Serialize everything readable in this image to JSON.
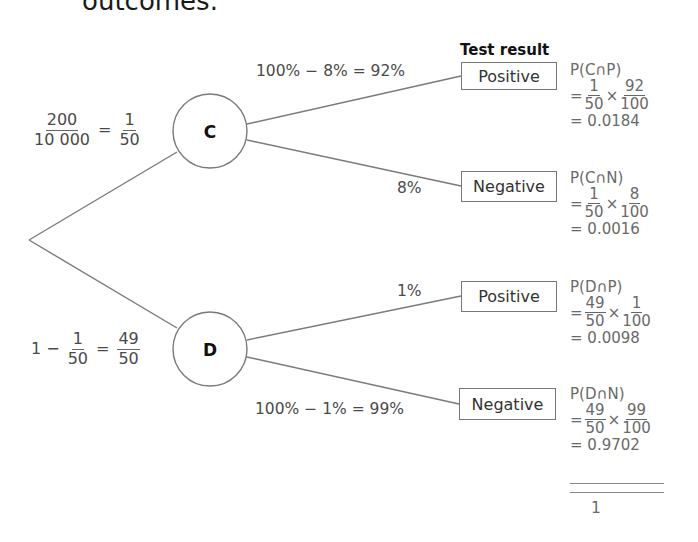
{
  "heading_fragment": "outcomes.",
  "test_result_title": "Test result",
  "geometry": {
    "root": [
      29,
      240
    ],
    "nodes": {
      "C": {
        "cx": 210,
        "cy": 131,
        "r": 37
      },
      "D": {
        "cx": 210,
        "cy": 349,
        "r": 37
      }
    },
    "boxes": [
      {
        "x": 461,
        "y": 62,
        "w": 96,
        "h": 28
      },
      {
        "x": 461,
        "y": 171,
        "w": 96,
        "h": 31
      },
      {
        "x": 461,
        "y": 281,
        "w": 96,
        "h": 31
      },
      {
        "x": 459,
        "y": 388,
        "w": 97,
        "h": 32
      }
    ]
  },
  "first_level": {
    "C": {
      "label": "C",
      "prob_lhs_num": "200",
      "prob_lhs_den": "10 000",
      "eq": "=",
      "prob_rhs_num": "1",
      "prob_rhs_den": "50"
    },
    "D": {
      "label": "D",
      "prob_prefix": "1 −",
      "prob_mid_num": "1",
      "prob_mid_den": "50",
      "eq": "=",
      "prob_rhs_num": "49",
      "prob_rhs_den": "50"
    }
  },
  "branches": [
    {
      "from": "C",
      "outcome": "Positive",
      "branch_label": "100% − 8% = 92%",
      "calc": {
        "title": "P(C∩P)",
        "f1_num": "1",
        "f1_den": "50",
        "f2_num": "92",
        "f2_den": "100",
        "result": "= 0.0184"
      }
    },
    {
      "from": "C",
      "outcome": "Negative",
      "branch_label": "8%",
      "calc": {
        "title": "P(C∩N)",
        "f1_num": "1",
        "f1_den": "50",
        "f2_num": "8",
        "f2_den": "100",
        "result": "= 0.0016"
      }
    },
    {
      "from": "D",
      "outcome": "Positive",
      "branch_label": "1%",
      "calc": {
        "title": "P(D∩P)",
        "f1_num": "49",
        "f1_den": "50",
        "f2_num": "1",
        "f2_den": "100",
        "result": "= 0.0098"
      }
    },
    {
      "from": "D",
      "outcome": "Negative",
      "branch_label": "100% − 1% = 99%",
      "calc": {
        "title": "P(D∩N)",
        "f1_num": "49",
        "f1_den": "50",
        "f2_num": "99",
        "f2_den": "100",
        "result": "= 0.9702"
      }
    }
  ],
  "calc_symbols": {
    "eq": "=",
    "times": "×"
  },
  "total": "1",
  "colors": {
    "line": "#7a7a7a",
    "text": "#4a4a4a",
    "box_border": "#777777"
  }
}
